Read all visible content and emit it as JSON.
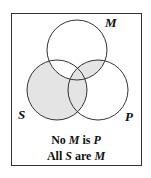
{
  "diagram": {
    "type": "venn-3",
    "circles": [
      {
        "id": "M",
        "label": "M"
      },
      {
        "id": "S",
        "label": "S"
      },
      {
        "id": "P",
        "label": "P"
      }
    ],
    "shaded_regions": [
      "S only",
      "S∩P not M",
      "M∩P not S",
      "S∩M∩P"
    ],
    "shade_color": "#e4e4e4",
    "statements": [
      {
        "parts": [
          {
            "t": "No ",
            "i": false
          },
          {
            "t": "M",
            "i": true
          },
          {
            "t": " is ",
            "i": false
          },
          {
            "t": "P",
            "i": true
          }
        ]
      },
      {
        "parts": [
          {
            "t": "All ",
            "i": false
          },
          {
            "t": "S",
            "i": true
          },
          {
            "t": " are ",
            "i": false
          },
          {
            "t": "M",
            "i": true
          }
        ]
      }
    ]
  }
}
